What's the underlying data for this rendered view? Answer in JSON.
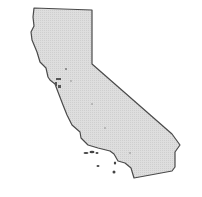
{
  "map": {
    "region": "California",
    "fill_color": "#dcdcdc",
    "stroke_color": "#4a4a4a"
  }
}
